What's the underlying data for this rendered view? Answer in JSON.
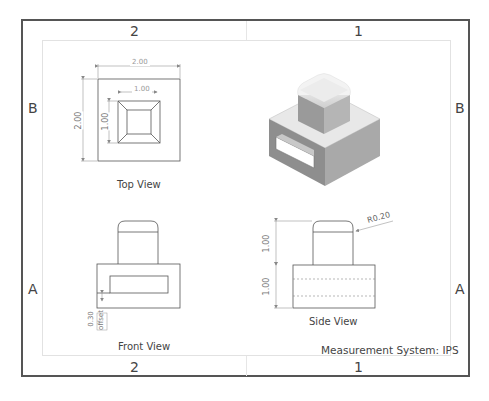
{
  "sheet": {
    "zones_top": [
      "2",
      "1"
    ],
    "zones_bottom": [
      "2",
      "1"
    ],
    "zones_left": [
      "B",
      "A"
    ],
    "zones_right": [
      "B",
      "A"
    ]
  },
  "views": {
    "top_view": {
      "caption": "Top View",
      "dims": {
        "outer_width": "2.00",
        "outer_height": "2.00",
        "inner_width": "1.00",
        "inner_height": "1.00"
      }
    },
    "isometric_view": {
      "caption": ""
    },
    "front_view": {
      "caption": "Front View",
      "dims": {
        "offset_value": "0.30",
        "offset_note": "offset"
      }
    },
    "side_view": {
      "caption": "Side View",
      "dims": {
        "radius": "R0.20",
        "upper_height": "1.00",
        "lower_height": "1.00"
      }
    }
  },
  "measurement_system": "Measurement System: IPS",
  "colors": {
    "border": "#555555",
    "line": "#555555",
    "dim_line": "#8a8a8a",
    "iso_top": "#e6e6e6",
    "iso_left": "#8c8c8c",
    "iso_right": "#a8a8a8"
  }
}
